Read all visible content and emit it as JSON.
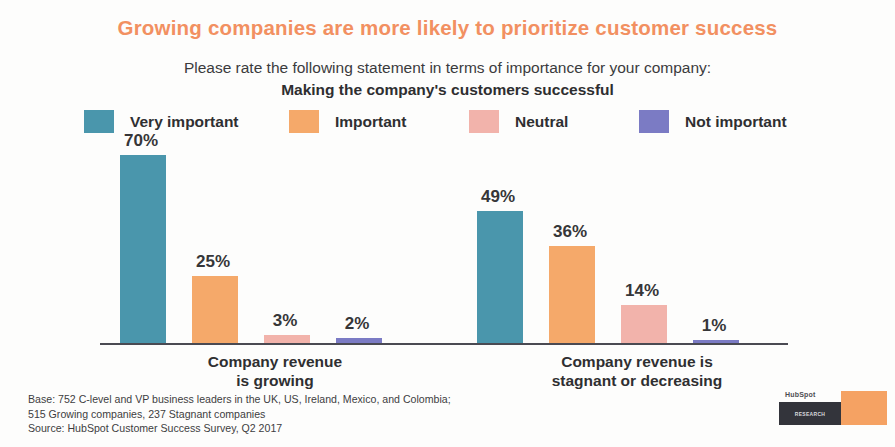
{
  "title": "Growing companies are more likely to prioritize customer success",
  "subtitle": {
    "line1": "Please rate the following statement in terms of importance for your company:",
    "line2": "Making the company's customers successful"
  },
  "footnote": {
    "line1": "Base: 752 C-level and VP business leaders in the UK, US, Ireland, Mexico, and Colombia;",
    "line2": "515 Growing companies, 237 Stagnant companies",
    "line3": "Source: HubSpot Customer Success Survey, Q2 2017"
  },
  "logo": {
    "wordmark": "HubSpot",
    "badge": "RESEARCH"
  },
  "colors": {
    "title": "#f29061",
    "very_important": "#4a96ac",
    "important": "#f5a96a",
    "neutral": "#f2b3ab",
    "not_important": "#7b7bc4",
    "axis": "#4a4a52",
    "text": "#2f2f31",
    "background": "#fdfdfc"
  },
  "chart_data": {
    "type": "bar",
    "title": "Growing companies are more likely to prioritize customer success",
    "subtitle": "Please rate the following statement in terms of importance for your company: Making the company's customers successful",
    "xlabel": "",
    "ylabel": "",
    "ylim": [
      0,
      70
    ],
    "grid": false,
    "legend_position": "top",
    "value_suffix": "%",
    "categories": [
      "Company revenue is growing",
      "Company revenue is stagnant or decreasing"
    ],
    "series": [
      {
        "name": "Very important",
        "color": "#4a96ac",
        "values": [
          70,
          49
        ],
        "labels": [
          "70%",
          "49%"
        ]
      },
      {
        "name": "Important",
        "color": "#f5a96a",
        "values": [
          25,
          36
        ],
        "labels": [
          "25%",
          "36%"
        ]
      },
      {
        "name": "Neutral",
        "color": "#f2b3ab",
        "values": [
          3,
          14
        ],
        "labels": [
          "3%",
          "14%"
        ]
      },
      {
        "name": "Not important",
        "color": "#7b7bc4",
        "values": [
          2,
          1
        ],
        "labels": [
          "2%",
          "1%"
        ]
      }
    ],
    "groups": [
      {
        "category_line1": "Company revenue",
        "category_line2": "is growing",
        "bars": [
          {
            "series": "Very important",
            "value": 70,
            "label": "70%",
            "color": "#4a96ac"
          },
          {
            "series": "Important",
            "value": 25,
            "label": "25%",
            "color": "#f5a96a"
          },
          {
            "series": "Neutral",
            "value": 3,
            "label": "3%",
            "color": "#f2b3ab"
          },
          {
            "series": "Not important",
            "value": 2,
            "label": "2%",
            "color": "#7b7bc4"
          }
        ]
      },
      {
        "category_line1": "Company revenue is",
        "category_line2": "stagnant or decreasing",
        "bars": [
          {
            "series": "Very important",
            "value": 49,
            "label": "49%",
            "color": "#4a96ac"
          },
          {
            "series": "Important",
            "value": 36,
            "label": "36%",
            "color": "#f5a96a"
          },
          {
            "series": "Neutral",
            "value": 14,
            "label": "14%",
            "color": "#f2b3ab"
          },
          {
            "series": "Not important",
            "value": 1,
            "label": "1%",
            "color": "#7b7bc4"
          }
        ]
      }
    ]
  }
}
